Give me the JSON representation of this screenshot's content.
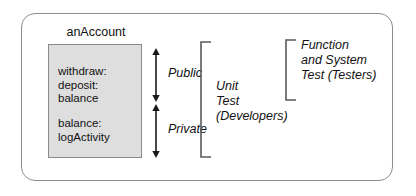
{
  "diagram": {
    "object": {
      "name": "anAccount",
      "public_methods": [
        "withdraw:",
        "deposit:",
        "balance"
      ],
      "private_methods": [
        "balance:",
        "logActivity"
      ]
    },
    "scopes": [
      {
        "label": "Public"
      },
      {
        "label": "Private"
      }
    ],
    "brackets": [
      {
        "label": "Unit\nTest\n(Developers)"
      },
      {
        "label": "Function\nand System\nTest (Testers)"
      }
    ],
    "colors": {
      "box_fill": "#dedede",
      "box_border": "#8a8a8a",
      "frame_border": "#8d8d8d",
      "stroke": "#333333",
      "text": "#111111"
    }
  }
}
